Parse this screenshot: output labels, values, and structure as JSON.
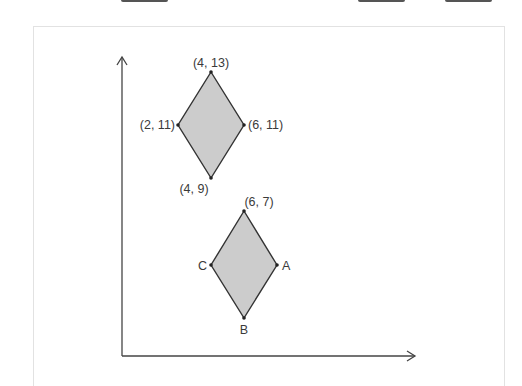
{
  "top_bar": {
    "tabs": [
      {
        "left": 121,
        "width": 47
      },
      {
        "left": 358,
        "width": 47
      },
      {
        "left": 445,
        "width": 47
      }
    ]
  },
  "figure": {
    "axes": {
      "y_axis": {
        "x": 122,
        "top": 57,
        "bottom": 356
      },
      "x_axis": {
        "y": 356,
        "left": 122,
        "right": 415
      }
    },
    "shape_fill": "#cccccc",
    "shape_stroke": "#333333",
    "diamonds": [
      {
        "name": "original-rhombus",
        "vertices": {
          "top": {
            "label": "(4, 13)"
          },
          "left": {
            "label": "(2, 11)"
          },
          "right": {
            "label": "(6, 11)"
          },
          "bottom": {
            "label": "(4, 9)"
          }
        }
      },
      {
        "name": "image-rhombus",
        "vertices": {
          "top": {
            "label": "(6, 7)"
          },
          "left": {
            "label": "C"
          },
          "right": {
            "label": "A"
          },
          "bottom": {
            "label": "B"
          }
        }
      }
    ]
  }
}
